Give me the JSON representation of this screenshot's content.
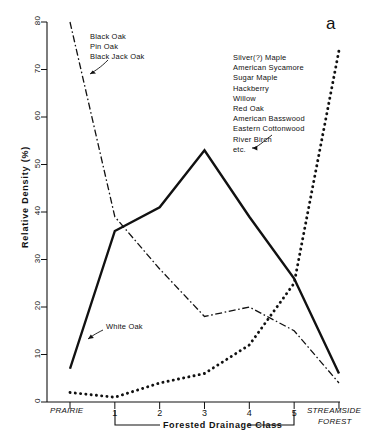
{
  "figure": {
    "panel_label": "a",
    "background": "#ffffff",
    "ink": "#111111"
  },
  "axes": {
    "y_title": "Relative Density (%)",
    "y_ticks": [
      "0",
      "10",
      "20",
      "30",
      "40",
      "50",
      "60",
      "70",
      "80"
    ],
    "x_bracket_label": "Forested Drainage Class",
    "x_ticks": [
      "1",
      "2",
      "3",
      "4",
      "5"
    ],
    "x_left_end": "PRAIRIE",
    "x_right_end_line1": "STREAMSIDE",
    "x_right_end_line2": "FOREST"
  },
  "annotations": {
    "left_group": {
      "lines": [
        "Black Oak",
        "Pin Oak",
        "Black Jack Oak"
      ],
      "points_to": "black-oak-series"
    },
    "right_group": {
      "lines": [
        "Silver(?) Maple",
        "American Sycamore",
        "Sugar Maple",
        "Hackberry",
        "Willow",
        "Red Oak",
        "American Basswood",
        "Eastern Cottonwood",
        "River Birch",
        "etc."
      ],
      "points_to": "mesic-species-series"
    },
    "white_oak": {
      "label": "White Oak",
      "points_to": "white-oak-series"
    }
  },
  "chart_data": {
    "type": "line",
    "title": "",
    "xlabel": "Forested Drainage Class",
    "ylabel": "Relative Density (%)",
    "ylim": [
      0,
      80
    ],
    "grid": false,
    "legend_position": "inline-annotations",
    "categories": [
      "PRAIRIE",
      "1",
      "2",
      "3",
      "4",
      "5",
      "STREAMSIDE FOREST"
    ],
    "x_positions": [
      0,
      1,
      2,
      3,
      4,
      5,
      6
    ],
    "series": [
      {
        "name": "White Oak",
        "style": "solid",
        "values": [
          7,
          36,
          41,
          53,
          39,
          26,
          6
        ]
      },
      {
        "name": "Black Oak, Pin Oak, Black Jack Oak",
        "style": "dash-dot",
        "values": [
          80,
          39,
          28,
          18,
          20,
          15,
          4
        ]
      },
      {
        "name": "Silver(?) Maple, American Sycamore, Sugar Maple, Hackberry, Willow, Red Oak, American Basswood, Eastern Cottonwood, River Birch, etc.",
        "style": "dotted",
        "values": [
          2,
          1,
          4,
          6,
          12,
          25,
          74
        ]
      }
    ]
  }
}
